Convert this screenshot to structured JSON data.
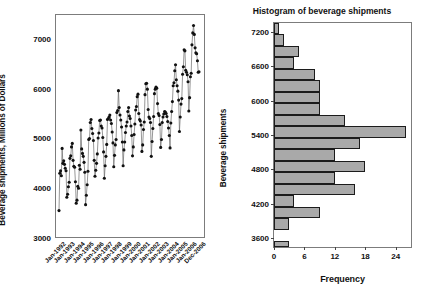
{
  "figure": {
    "background_color": "#ffffff",
    "frame_color": "#7c7c7c",
    "marker_color": "#111111",
    "bar_fill_color": "#a9a9a9",
    "bar_edge_color": "#1c1c1c"
  },
  "chart_data": [
    {
      "type": "line",
      "id": "beverage-time-series",
      "title": "",
      "xlabel": "",
      "ylabel": "Beverage shipments, Millions of Dollars",
      "ylim": [
        3000,
        7500
      ],
      "yticks": [
        3000,
        4000,
        5000,
        6000,
        7000
      ],
      "ytick_labels": [
        "3000",
        "4000",
        "5000",
        "6000",
        "7000"
      ],
      "xtick_labels": [
        "Jan-1992",
        "Jan-1993",
        "Jan-1994",
        "Jan-1995",
        "Jan-1996",
        "Jan-1997",
        "Jan-1998",
        "Jan-1999",
        "Jan-2000",
        "Jan-2001",
        "Jan-2002",
        "Jan-2003",
        "Jan-2004",
        "Jan-2005",
        "Jan-2006",
        "Dec-2006"
      ],
      "grid": false,
      "legend": "none",
      "marker": "filled-circle",
      "x_start_label": "Jan-1992",
      "x_end_label": "Dec-2006",
      "n_points": 180,
      "values": [
        3550,
        4300,
        4350,
        4250,
        4800,
        4500,
        4550,
        4480,
        4400,
        4350,
        3820,
        3880,
        4030,
        4120,
        4600,
        4650,
        4830,
        4900,
        4560,
        4440,
        4420,
        4130,
        3700,
        3760,
        4040,
        4000,
        4460,
        4380,
        5170,
        4790,
        4700,
        4640,
        4520,
        4320,
        3670,
        3860,
        4070,
        4340,
        4980,
        5000,
        5320,
        5380,
        5200,
        5100,
        4960,
        4560,
        4240,
        4360,
        4500,
        4690,
        5010,
        5110,
        5360,
        5370,
        5250,
        5210,
        5020,
        4730,
        4200,
        4450,
        4640,
        4880,
        5380,
        5400,
        5430,
        5470,
        5370,
        5300,
        5130,
        4910,
        4430,
        4660,
        4870,
        4980,
        5520,
        5560,
        5960,
        5620,
        5470,
        5370,
        5230,
        4930,
        4450,
        4770,
        4930,
        5120,
        5250,
        5330,
        5540,
        5620,
        5450,
        5400,
        5250,
        5060,
        4650,
        4830,
        5080,
        5290,
        5570,
        5640,
        5840,
        5890,
        5500,
        5380,
        5350,
        5270,
        4740,
        4870,
        5180,
        5330,
        5880,
        6100,
        6110,
        5990,
        5580,
        5430,
        5400,
        5320,
        4640,
        4940,
        5200,
        5440,
        5900,
        5990,
        6030,
        6010,
        5700,
        5500,
        5460,
        5280,
        4820,
        4980,
        5320,
        5430,
        5490,
        5540,
        5530,
        5500,
        5440,
        5340,
        5210,
        5060,
        4810,
        5310,
        5540,
        5740,
        6060,
        6120,
        6360,
        6480,
        6180,
        6060,
        5950,
        5770,
        5140,
        5430,
        5690,
        5800,
        6290,
        6440,
        6780,
        6760,
        6370,
        6330,
        6280,
        6140,
        5550,
        5820,
        6240,
        6310,
        6880,
        7120,
        7270,
        7090,
        6820,
        6720,
        6700,
        6560,
        6330,
        6340
      ]
    },
    {
      "type": "bar",
      "orientation": "horizontal",
      "id": "beverage-histogram",
      "title": "Histogram of beverage shipments",
      "xlabel": "Frequency",
      "ylabel": "Beverage shipments",
      "xlim": [
        0,
        27
      ],
      "ylim": [
        3450,
        7350
      ],
      "xticks": [
        0,
        6,
        12,
        18,
        24
      ],
      "xtick_labels": [
        "0",
        "6",
        "12",
        "18",
        "24"
      ],
      "yticks": [
        3600,
        4200,
        4800,
        5400,
        6000,
        6600,
        7200
      ],
      "ytick_labels": [
        "3600",
        "4200",
        "4800",
        "5400",
        "6000",
        "6600",
        "7200"
      ],
      "grid": false,
      "legend": "none",
      "bin_width": 200,
      "bin_centers": [
        3550,
        3750,
        3950,
        4150,
        4350,
        4550,
        4750,
        4950,
        5150,
        5350,
        5550,
        5750,
        5950,
        6150,
        6350,
        6550,
        6750,
        6950,
        7150,
        7250
      ],
      "bins": [
        {
          "center": 7250,
          "low": 7150,
          "high": 7350,
          "frequency": 1
        },
        {
          "center": 7050,
          "low": 6950,
          "high": 7150,
          "frequency": 2
        },
        {
          "center": 6850,
          "low": 6750,
          "high": 6950,
          "frequency": 5
        },
        {
          "center": 6650,
          "low": 6550,
          "high": 6750,
          "frequency": 4
        },
        {
          "center": 6450,
          "low": 6350,
          "high": 6550,
          "frequency": 8
        },
        {
          "center": 6250,
          "low": 6150,
          "high": 6350,
          "frequency": 9
        },
        {
          "center": 6050,
          "low": 5950,
          "high": 6150,
          "frequency": 9
        },
        {
          "center": 5850,
          "low": 5750,
          "high": 5950,
          "frequency": 9
        },
        {
          "center": 5650,
          "low": 5550,
          "high": 5750,
          "frequency": 14
        },
        {
          "center": 5450,
          "low": 5350,
          "high": 5550,
          "frequency": 26
        },
        {
          "center": 5250,
          "low": 5150,
          "high": 5350,
          "frequency": 17
        },
        {
          "center": 5050,
          "low": 4950,
          "high": 5150,
          "frequency": 12
        },
        {
          "center": 4850,
          "low": 4750,
          "high": 4950,
          "frequency": 18
        },
        {
          "center": 4650,
          "low": 4550,
          "high": 4750,
          "frequency": 12
        },
        {
          "center": 4450,
          "low": 4350,
          "high": 4550,
          "frequency": 16
        },
        {
          "center": 4250,
          "low": 4150,
          "high": 4350,
          "frequency": 4
        },
        {
          "center": 4050,
          "low": 3950,
          "high": 4150,
          "frequency": 9
        },
        {
          "center": 3850,
          "low": 3750,
          "high": 3950,
          "frequency": 3
        },
        {
          "center": 3650,
          "low": 3550,
          "high": 3750,
          "frequency": 0
        },
        {
          "center": 3500,
          "low": 3450,
          "high": 3550,
          "frequency": 3
        }
      ]
    }
  ]
}
